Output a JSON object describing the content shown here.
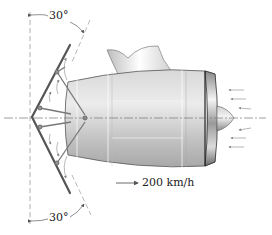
{
  "figure": {
    "type": "engineering-diagram",
    "labels": {
      "angle_top": "30°",
      "angle_bottom": "30°",
      "speed": "200 km/h"
    },
    "annotations": {
      "angle_top_deg": 30,
      "angle_bottom_deg": 30,
      "speed_value": 200,
      "speed_unit": "km/h",
      "speed_direction": "right"
    },
    "colors": {
      "line": "#333333",
      "engine_body_light": "#e8e8e8",
      "engine_body_dark": "#9a9a9a",
      "reverser_plate": "#555555",
      "flow_arrows": "#888888",
      "centerline": "#777777"
    }
  }
}
